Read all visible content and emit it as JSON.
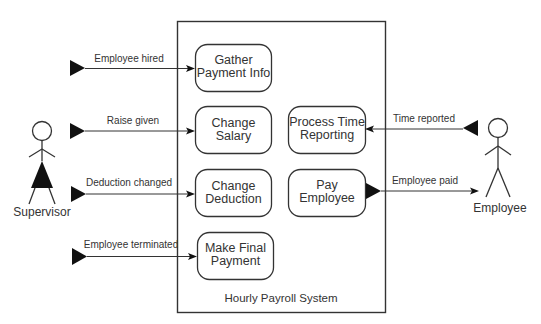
{
  "system": {
    "label": "Hourly Payroll System"
  },
  "actors": {
    "supervisor": {
      "label": "Supervisor",
      "icon": "stick-figure-dress"
    },
    "employee": {
      "label": "Employee",
      "icon": "stick-figure"
    }
  },
  "use_cases": {
    "gather_payment_info": {
      "line1": "Gather",
      "line2": "Payment Info"
    },
    "change_salary": {
      "line1": "Change",
      "line2": "Salary"
    },
    "change_deduction": {
      "line1": "Change",
      "line2": "Deduction"
    },
    "make_final_payment": {
      "line1": "Make Final",
      "line2": "Payment"
    },
    "process_time_reporting": {
      "line1": "Process Time",
      "line2": "Reporting"
    },
    "pay_employee": {
      "line1": "Pay",
      "line2": "Employee"
    }
  },
  "flows": {
    "employee_hired": {
      "label": "Employee hired"
    },
    "raise_given": {
      "label": "Raise given"
    },
    "deduction_changed": {
      "label": "Deduction changed"
    },
    "employee_terminated": {
      "label": "Employee terminated"
    },
    "time_reported": {
      "label": "Time reported"
    },
    "employee_paid": {
      "label": "Employee paid"
    }
  },
  "colors": {
    "line": "#333333",
    "background": "#ffffff"
  }
}
